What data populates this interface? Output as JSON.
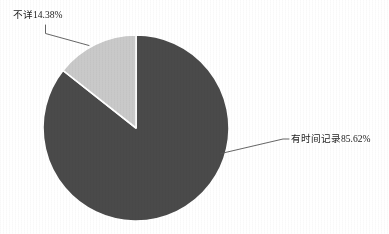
{
  "chart_data": {
    "type": "pie",
    "title": "",
    "subtitle": "",
    "xlabel": "",
    "ylabel": "",
    "legend_position": "none",
    "grid": false,
    "labels_outside": true,
    "start_angle_deg": 0,
    "direction": "clockwise",
    "categories": [
      "有时间记录",
      "不详"
    ],
    "values": [
      85.62,
      14.38
    ],
    "units": "%",
    "slices": [
      {
        "name": "有时间记录",
        "value": 85.62,
        "label": "有时间记录85.62%",
        "color": "#4a4a4a",
        "start_deg": 0,
        "end_deg": 308.23
      },
      {
        "name": "不详",
        "value": 14.38,
        "label": "不详14.38%",
        "color": "#c9c9c9",
        "start_deg": 308.23,
        "end_deg": 360
      }
    ]
  },
  "figure": {
    "background_color": "#ffffff",
    "slice_border_color": "#ffffff",
    "leader_line_color": "#555555",
    "text_color": "#1c1c1c",
    "center_x": 136,
    "center_y": 128,
    "radius": 93
  },
  "labels": {
    "unknown": "不详14.38%",
    "recorded": "有时间记录85.62%"
  }
}
